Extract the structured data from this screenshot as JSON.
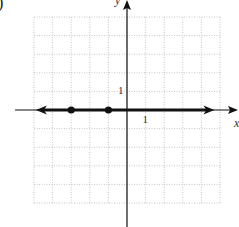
{
  "figure": {
    "corner_mark": ")"
  },
  "chart_data": {
    "type": "line",
    "title": "",
    "xlabel": "x",
    "ylabel": "y",
    "xlim": [
      -5,
      5
    ],
    "ylim": [
      -5,
      5
    ],
    "grid": true,
    "grid_style": "dotted",
    "tick_labels": {
      "x": [
        {
          "value": 1,
          "label": "1"
        }
      ],
      "y": [
        {
          "value": 1,
          "label": "1"
        }
      ]
    },
    "series": [
      {
        "name": "solution-line",
        "description": "thick line along the x-axis (y = 0) with arrows on both ends",
        "x": [
          -4.9,
          4.7
        ],
        "y": [
          0,
          0
        ],
        "arrows": "both"
      },
      {
        "name": "points",
        "type": "scatter",
        "marker": "filled-circle",
        "x": [
          -3,
          -1
        ],
        "y": [
          0,
          0
        ]
      }
    ],
    "legend": null
  },
  "colors": {
    "axis": "#111111",
    "grid": "#b8b8b8",
    "line": "#111111",
    "label": "#333333"
  }
}
